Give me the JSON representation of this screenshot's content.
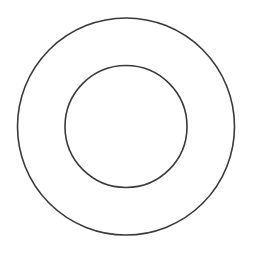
{
  "diagram": {
    "type": "concentric-circles",
    "background": "#ffffff",
    "stroke_color": "#3a3a3a",
    "stroke_width": 1.6,
    "center": {
      "x": 126,
      "y": 126.5
    },
    "circles": [
      {
        "name": "outer",
        "r": 108.5
      },
      {
        "name": "inner",
        "r": 61
      }
    ]
  }
}
